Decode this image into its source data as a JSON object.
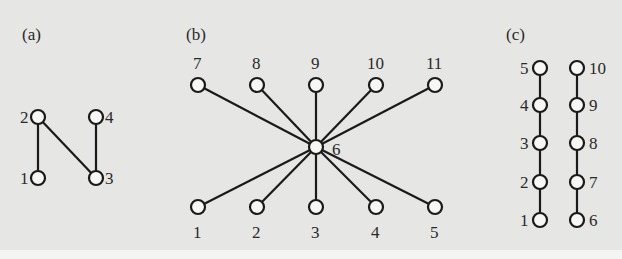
{
  "figure": {
    "background": "#e6e6e4",
    "panels": [
      {
        "label": "(a)",
        "label_pos": [
          22,
          40
        ],
        "nodes": [
          {
            "id": "1",
            "x": 38,
            "y": 178,
            "lx": 20,
            "ly": 184
          },
          {
            "id": "2",
            "x": 38,
            "y": 117,
            "lx": 20,
            "ly": 123
          },
          {
            "id": "3",
            "x": 96,
            "y": 178,
            "lx": 105,
            "ly": 184
          },
          {
            "id": "4",
            "x": 96,
            "y": 117,
            "lx": 105,
            "ly": 123
          }
        ],
        "edges": [
          [
            "1",
            "2"
          ],
          [
            "2",
            "3"
          ],
          [
            "3",
            "4"
          ]
        ]
      },
      {
        "label": "(b)",
        "label_pos": [
          186,
          40
        ],
        "nodes": [
          {
            "id": "1",
            "x": 198,
            "y": 207,
            "lx": 193,
            "ly": 238
          },
          {
            "id": "2",
            "x": 257,
            "y": 207,
            "lx": 252,
            "ly": 238
          },
          {
            "id": "3",
            "x": 316,
            "y": 207,
            "lx": 311,
            "ly": 238
          },
          {
            "id": "4",
            "x": 376,
            "y": 207,
            "lx": 371,
            "ly": 238
          },
          {
            "id": "5",
            "x": 435,
            "y": 207,
            "lx": 430,
            "ly": 238
          },
          {
            "id": "6",
            "x": 316,
            "y": 147,
            "lx": 332,
            "ly": 155
          },
          {
            "id": "7",
            "x": 198,
            "y": 85,
            "lx": 193,
            "ly": 69
          },
          {
            "id": "8",
            "x": 257,
            "y": 85,
            "lx": 252,
            "ly": 69
          },
          {
            "id": "9",
            "x": 316,
            "y": 85,
            "lx": 311,
            "ly": 69
          },
          {
            "id": "10",
            "x": 376,
            "y": 85,
            "lx": 367,
            "ly": 69
          },
          {
            "id": "11",
            "x": 435,
            "y": 85,
            "lx": 426,
            "ly": 69
          }
        ],
        "edges": [
          [
            "6",
            "1"
          ],
          [
            "6",
            "2"
          ],
          [
            "6",
            "3"
          ],
          [
            "6",
            "4"
          ],
          [
            "6",
            "5"
          ],
          [
            "6",
            "7"
          ],
          [
            "6",
            "8"
          ],
          [
            "6",
            "9"
          ],
          [
            "6",
            "10"
          ],
          [
            "6",
            "11"
          ]
        ]
      },
      {
        "label": "(c)",
        "label_pos": [
          506,
          40
        ],
        "nodes": [
          {
            "id": "1",
            "x": 540,
            "y": 220,
            "lx": 520,
            "ly": 226
          },
          {
            "id": "2",
            "x": 540,
            "y": 182,
            "lx": 520,
            "ly": 188
          },
          {
            "id": "3",
            "x": 540,
            "y": 143,
            "lx": 520,
            "ly": 149
          },
          {
            "id": "4",
            "x": 540,
            "y": 105,
            "lx": 520,
            "ly": 111
          },
          {
            "id": "5",
            "x": 540,
            "y": 68,
            "lx": 520,
            "ly": 74
          },
          {
            "id": "6",
            "x": 577,
            "y": 220,
            "lx": 589,
            "ly": 226
          },
          {
            "id": "7",
            "x": 577,
            "y": 182,
            "lx": 589,
            "ly": 188
          },
          {
            "id": "8",
            "x": 577,
            "y": 143,
            "lx": 589,
            "ly": 149
          },
          {
            "id": "9",
            "x": 577,
            "y": 105,
            "lx": 589,
            "ly": 111
          },
          {
            "id": "10",
            "x": 577,
            "y": 68,
            "lx": 589,
            "ly": 74
          }
        ],
        "edges": [
          [
            "1",
            "2"
          ],
          [
            "2",
            "3"
          ],
          [
            "3",
            "4"
          ],
          [
            "4",
            "5"
          ],
          [
            "6",
            "7"
          ],
          [
            "7",
            "8"
          ],
          [
            "8",
            "9"
          ],
          [
            "9",
            "10"
          ]
        ]
      }
    ]
  }
}
